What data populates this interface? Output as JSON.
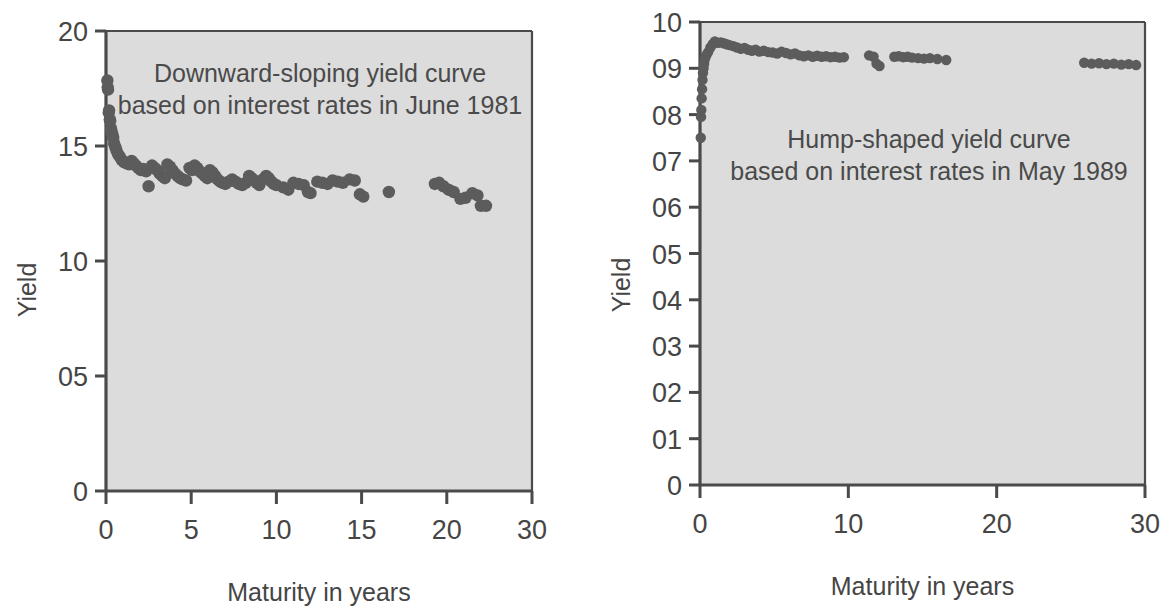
{
  "figure": {
    "background_color": "#ffffff",
    "plot_background_color": "#dcdcdc",
    "point_color": "#5c5c5c",
    "axis_color": "#4a4a4a"
  },
  "chart_data": [
    {
      "type": "scatter",
      "id": "left",
      "title": "Downward-sloping yield curve\nbased on interest rates in June 1981",
      "annotation_line_1": "Downward-sloping yield curve",
      "annotation_line_2": "based on interest rates in June 1981",
      "xlabel": "Maturity in years",
      "ylabel": "Yield",
      "xlim": [
        0,
        25
      ],
      "ylim": [
        0,
        20
      ],
      "xticks": [
        0,
        5,
        10,
        15,
        20,
        25
      ],
      "xtick_labels": [
        "0",
        "5",
        "10",
        "15",
        "20",
        "30"
      ],
      "yticks": [
        0,
        5,
        10,
        15,
        20
      ],
      "ytick_labels": [
        "0",
        "05",
        "10",
        "15",
        "20"
      ],
      "grid": false,
      "legend": "none",
      "points": [
        [
          0.08,
          17.85
        ],
        [
          0.1,
          17.55
        ],
        [
          0.12,
          17.45
        ],
        [
          0.16,
          16.45
        ],
        [
          0.18,
          16.55
        ],
        [
          0.22,
          16.15
        ],
        [
          0.25,
          16.1
        ],
        [
          0.3,
          15.75
        ],
        [
          0.33,
          15.6
        ],
        [
          0.38,
          15.5
        ],
        [
          0.42,
          15.35
        ],
        [
          0.48,
          15.1
        ],
        [
          0.55,
          14.95
        ],
        [
          0.62,
          14.8
        ],
        [
          0.7,
          14.65
        ],
        [
          0.8,
          14.55
        ],
        [
          0.92,
          14.4
        ],
        [
          1.05,
          14.3
        ],
        [
          1.2,
          14.25
        ],
        [
          1.35,
          14.2
        ],
        [
          1.5,
          14.35
        ],
        [
          1.62,
          14.25
        ],
        [
          1.75,
          14.15
        ],
        [
          1.9,
          14.05
        ],
        [
          2.05,
          13.95
        ],
        [
          2.2,
          14.0
        ],
        [
          2.35,
          13.9
        ],
        [
          2.5,
          13.25
        ],
        [
          2.7,
          14.15
        ],
        [
          2.85,
          14.05
        ],
        [
          3.0,
          13.95
        ],
        [
          3.15,
          13.8
        ],
        [
          3.3,
          13.7
        ],
        [
          3.45,
          13.6
        ],
        [
          3.6,
          14.2
        ],
        [
          3.75,
          14.1
        ],
        [
          3.9,
          13.95
        ],
        [
          4.05,
          13.8
        ],
        [
          4.2,
          13.7
        ],
        [
          4.35,
          13.6
        ],
        [
          4.5,
          13.55
        ],
        [
          4.7,
          13.5
        ],
        [
          4.9,
          14.05
        ],
        [
          5.05,
          13.95
        ],
        [
          5.2,
          14.15
        ],
        [
          5.35,
          14.05
        ],
        [
          5.5,
          13.9
        ],
        [
          5.65,
          13.8
        ],
        [
          5.8,
          13.7
        ],
        [
          5.95,
          13.6
        ],
        [
          6.1,
          13.95
        ],
        [
          6.25,
          13.85
        ],
        [
          6.4,
          13.7
        ],
        [
          6.55,
          13.55
        ],
        [
          6.7,
          13.45
        ],
        [
          6.85,
          13.4
        ],
        [
          7.0,
          13.35
        ],
        [
          7.2,
          13.45
        ],
        [
          7.4,
          13.55
        ],
        [
          7.6,
          13.45
        ],
        [
          7.8,
          13.35
        ],
        [
          8.0,
          13.3
        ],
        [
          8.2,
          13.4
        ],
        [
          8.4,
          13.7
        ],
        [
          8.55,
          13.6
        ],
        [
          8.7,
          13.5
        ],
        [
          8.85,
          13.4
        ],
        [
          9.0,
          13.3
        ],
        [
          9.2,
          13.55
        ],
        [
          9.4,
          13.7
        ],
        [
          9.55,
          13.6
        ],
        [
          9.7,
          13.45
        ],
        [
          9.85,
          13.35
        ],
        [
          10.0,
          13.3
        ],
        [
          10.4,
          13.2
        ],
        [
          10.7,
          13.1
        ],
        [
          11.0,
          13.4
        ],
        [
          11.3,
          13.35
        ],
        [
          11.6,
          13.3
        ],
        [
          11.85,
          13.0
        ],
        [
          12.0,
          12.95
        ],
        [
          12.4,
          13.45
        ],
        [
          12.7,
          13.4
        ],
        [
          13.0,
          13.35
        ],
        [
          13.3,
          13.5
        ],
        [
          13.6,
          13.45
        ],
        [
          13.9,
          13.4
        ],
        [
          14.3,
          13.55
        ],
        [
          14.6,
          13.5
        ],
        [
          14.9,
          12.9
        ],
        [
          15.1,
          12.8
        ],
        [
          16.6,
          13.0
        ],
        [
          19.3,
          13.35
        ],
        [
          19.55,
          13.4
        ],
        [
          19.8,
          13.25
        ],
        [
          20.1,
          13.1
        ],
        [
          20.4,
          13.0
        ],
        [
          20.8,
          12.7
        ],
        [
          21.1,
          12.75
        ],
        [
          21.5,
          12.95
        ],
        [
          21.8,
          12.85
        ],
        [
          22.0,
          12.4
        ],
        [
          22.3,
          12.4
        ]
      ]
    },
    {
      "type": "scatter",
      "id": "right",
      "title": "Hump-shaped yield curve\nbased on interest rates in May 1989",
      "annotation_line_1": "Hump-shaped yield curve",
      "annotation_line_2": "based on interest rates in May 1989",
      "xlabel": "Maturity in years",
      "ylabel": "Yield",
      "xlim": [
        0,
        30
      ],
      "ylim": [
        0,
        10
      ],
      "xticks": [
        0,
        10,
        20,
        30
      ],
      "xtick_labels": [
        "0",
        "10",
        "20",
        "30"
      ],
      "yticks": [
        0,
        1,
        2,
        3,
        4,
        5,
        6,
        7,
        8,
        9,
        10
      ],
      "ytick_labels": [
        "0",
        "01",
        "02",
        "03",
        "04",
        "05",
        "06",
        "07",
        "08",
        "09",
        "10"
      ],
      "grid": false,
      "legend": "none",
      "points": [
        [
          0.05,
          7.5
        ],
        [
          0.07,
          7.95
        ],
        [
          0.09,
          8.1
        ],
        [
          0.11,
          8.35
        ],
        [
          0.14,
          8.55
        ],
        [
          0.17,
          8.75
        ],
        [
          0.2,
          8.9
        ],
        [
          0.24,
          9.0
        ],
        [
          0.28,
          9.1
        ],
        [
          0.33,
          9.2
        ],
        [
          0.38,
          9.25
        ],
        [
          0.45,
          9.3
        ],
        [
          0.55,
          9.35
        ],
        [
          0.7,
          9.45
        ],
        [
          0.85,
          9.52
        ],
        [
          1.0,
          9.58
        ],
        [
          1.2,
          9.55
        ],
        [
          1.4,
          9.56
        ],
        [
          1.6,
          9.54
        ],
        [
          1.8,
          9.52
        ],
        [
          2.0,
          9.5
        ],
        [
          2.25,
          9.48
        ],
        [
          2.5,
          9.45
        ],
        [
          2.75,
          9.42
        ],
        [
          3.0,
          9.44
        ],
        [
          3.25,
          9.4
        ],
        [
          3.5,
          9.38
        ],
        [
          3.75,
          9.4
        ],
        [
          4.0,
          9.36
        ],
        [
          4.3,
          9.38
        ],
        [
          4.6,
          9.35
        ],
        [
          4.9,
          9.34
        ],
        [
          5.2,
          9.32
        ],
        [
          5.5,
          9.36
        ],
        [
          5.8,
          9.33
        ],
        [
          6.1,
          9.3
        ],
        [
          6.4,
          9.32
        ],
        [
          6.7,
          9.28
        ],
        [
          7.0,
          9.26
        ],
        [
          7.3,
          9.28
        ],
        [
          7.6,
          9.25
        ],
        [
          7.9,
          9.27
        ],
        [
          8.2,
          9.25
        ],
        [
          8.5,
          9.26
        ],
        [
          8.8,
          9.24
        ],
        [
          9.1,
          9.25
        ],
        [
          9.4,
          9.23
        ],
        [
          9.7,
          9.24
        ],
        [
          11.4,
          9.28
        ],
        [
          11.7,
          9.25
        ],
        [
          11.9,
          9.1
        ],
        [
          12.1,
          9.05
        ],
        [
          13.1,
          9.25
        ],
        [
          13.4,
          9.26
        ],
        [
          13.7,
          9.24
        ],
        [
          14.0,
          9.25
        ],
        [
          14.3,
          9.23
        ],
        [
          14.7,
          9.22
        ],
        [
          15.1,
          9.21
        ],
        [
          15.5,
          9.22
        ],
        [
          16.0,
          9.2
        ],
        [
          16.6,
          9.18
        ],
        [
          25.9,
          9.12
        ],
        [
          26.4,
          9.1
        ],
        [
          26.9,
          9.11
        ],
        [
          27.4,
          9.09
        ],
        [
          27.9,
          9.1
        ],
        [
          28.4,
          9.08
        ],
        [
          28.9,
          9.09
        ],
        [
          29.4,
          9.07
        ]
      ]
    }
  ]
}
